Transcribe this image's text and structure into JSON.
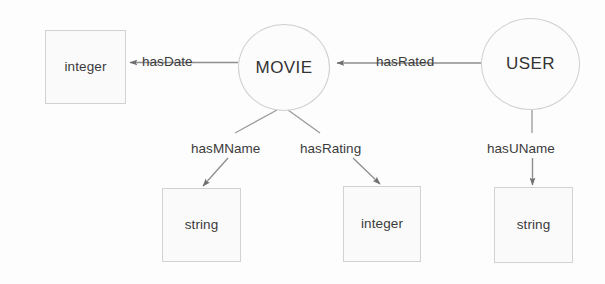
{
  "diagram": {
    "type": "directed-graph",
    "colors": {
      "background": "#fdfdfd",
      "node_fill": "#fafafa",
      "node_stroke": "#d2d2d2",
      "edge_stroke": "#8e8e8e",
      "text": "#3b3b3b"
    },
    "nodes": [
      {
        "id": "integer_date",
        "label": "integer",
        "shape": "rectangle",
        "x": 45,
        "y": 30,
        "w": 81,
        "h": 74
      },
      {
        "id": "movie",
        "label": "MOVIE",
        "shape": "ellipse",
        "x": 238,
        "y": 24,
        "w": 92,
        "h": 87
      },
      {
        "id": "user",
        "label": "USER",
        "shape": "ellipse",
        "x": 481,
        "y": 18,
        "w": 99,
        "h": 92
      },
      {
        "id": "string_mname",
        "label": "string",
        "shape": "rectangle",
        "x": 162,
        "y": 188,
        "w": 79,
        "h": 74
      },
      {
        "id": "integer_rating",
        "label": "integer",
        "shape": "rectangle",
        "x": 343,
        "y": 186,
        "w": 78,
        "h": 76
      },
      {
        "id": "string_uname",
        "label": "string",
        "shape": "rectangle",
        "x": 494,
        "y": 187,
        "w": 79,
        "h": 76
      }
    ],
    "edges": [
      {
        "id": "hasDate",
        "label": "hasDate",
        "from": "movie",
        "to": "integer_date",
        "label_x": 142,
        "label_y": 54
      },
      {
        "id": "hasRated",
        "label": "hasRated",
        "from": "user",
        "to": "movie",
        "label_x": 376,
        "label_y": 54
      },
      {
        "id": "hasMName",
        "label": "hasMName",
        "from": "movie",
        "to": "string_mname",
        "label_x": 191,
        "label_y": 141
      },
      {
        "id": "hasRating",
        "label": "hasRating",
        "from": "movie",
        "to": "integer_rating",
        "label_x": 300,
        "label_y": 141
      },
      {
        "id": "hasUName",
        "label": "hasUName",
        "from": "user",
        "to": "string_uname",
        "label_x": 487,
        "label_y": 141
      }
    ]
  }
}
